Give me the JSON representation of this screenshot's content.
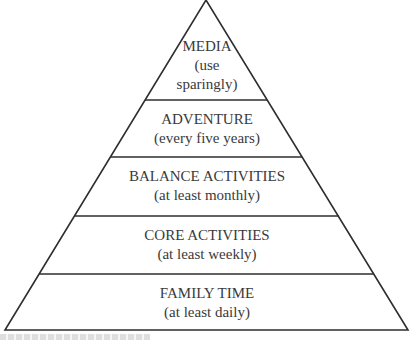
{
  "diagram": {
    "type": "pyramid",
    "colors": {
      "stroke": "#2e2e2e",
      "text": "#3a3a3a",
      "background": "#ffffff"
    },
    "levels": [
      {
        "title": "MEDIA",
        "lines": [
          "(use",
          "sparingly)"
        ]
      },
      {
        "title": "ADVENTURE",
        "lines": [
          "(every five years)"
        ]
      },
      {
        "title": "BALANCE ACTIVITIES",
        "lines": [
          "(at least monthly)"
        ]
      },
      {
        "title": "CORE ACTIVITIES",
        "lines": [
          "(at least weekly)"
        ]
      },
      {
        "title": "FAMILY TIME",
        "lines": [
          "(at least daily)"
        ]
      }
    ]
  }
}
